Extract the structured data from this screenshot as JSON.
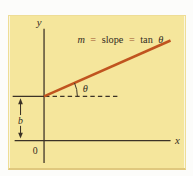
{
  "figure": {
    "formula": {
      "m": "m",
      "eq1": "=",
      "slope_word": "slope",
      "eq2": "=",
      "tan": "tan",
      "theta": "θ"
    },
    "labels": {
      "y_axis": "y",
      "x_axis": "x",
      "origin": "0",
      "intercept": "b",
      "angle": "θ"
    },
    "colors": {
      "panel_background": "#f5e69c",
      "slope_line": "#c0541f",
      "axis": "#3b3226",
      "text": "#332b1e",
      "equals": "#9a512e"
    }
  }
}
